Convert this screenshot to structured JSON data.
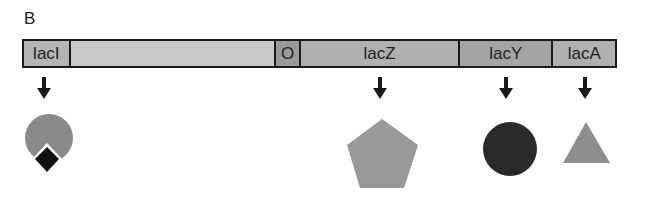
{
  "panel_label": "B",
  "operon": {
    "segments": [
      {
        "id": "lacI",
        "label": "lacI",
        "width": 47,
        "fill": "#b4b4b4"
      },
      {
        "id": "spacer",
        "label": "",
        "width": 207,
        "fill": "#c8c8c8"
      },
      {
        "id": "operator",
        "label": "O",
        "width": 25,
        "fill": "#9a9a9a"
      },
      {
        "id": "lacZ",
        "label": "lacZ",
        "width": 160,
        "fill": "#b0b0b0"
      },
      {
        "id": "lacY",
        "label": "lacY",
        "width": 94,
        "fill": "#a4a4a4"
      },
      {
        "id": "lacA",
        "label": "lacA",
        "width": 62,
        "fill": "#b0b0b0"
      }
    ]
  },
  "products": [
    {
      "gene": "lacI",
      "shape": "circle-with-diamond",
      "description": "repressor protein",
      "colors": {
        "circle": "#8a8a8a",
        "diamond": "#111111"
      }
    },
    {
      "gene": "lacZ",
      "shape": "pentagon",
      "colors": {
        "fill": "#999999"
      }
    },
    {
      "gene": "lacY",
      "shape": "circle",
      "colors": {
        "fill": "#2a2a2a"
      }
    },
    {
      "gene": "lacA",
      "shape": "triangle",
      "colors": {
        "fill": "#8e8e8e"
      }
    }
  ],
  "arrows": [
    {
      "gene": "lacI",
      "x": 44
    },
    {
      "gene": "lacZ",
      "x": 380
    },
    {
      "gene": "lacY",
      "x": 506
    },
    {
      "gene": "lacA",
      "x": 585
    }
  ]
}
